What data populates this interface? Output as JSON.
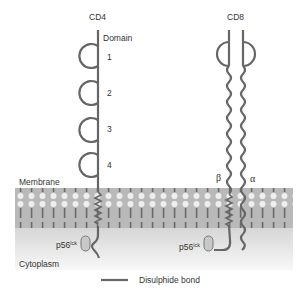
{
  "colors": {
    "strand": "#666666",
    "membrane_band": "#b9b9b9",
    "lipid_head": "#efefef",
    "lipid_tail": "#6a6a6a",
    "cytoplasm_top": "#d9d9d9",
    "cytoplasm_bottom": "#f7f7f7",
    "kinase_fill": "#c8c8c8",
    "text": "#333333"
  },
  "cd4": {
    "label": "CD4",
    "domain_heading": "Domain",
    "domains": [
      "1",
      "2",
      "3",
      "4"
    ],
    "kinase": {
      "base": "p56",
      "sup": "lck"
    }
  },
  "cd8": {
    "label": "CD8",
    "chains": [
      {
        "name": "beta",
        "symbol": "β"
      },
      {
        "name": "alpha",
        "symbol": "α"
      }
    ],
    "kinase": {
      "base": "p56",
      "sup": "lck"
    }
  },
  "regions": {
    "membrane": "Membrane",
    "cytoplasm": "Cytoplasm"
  },
  "legend": {
    "items": [
      {
        "symbol": "line",
        "label": "Disulphide bond"
      }
    ]
  }
}
